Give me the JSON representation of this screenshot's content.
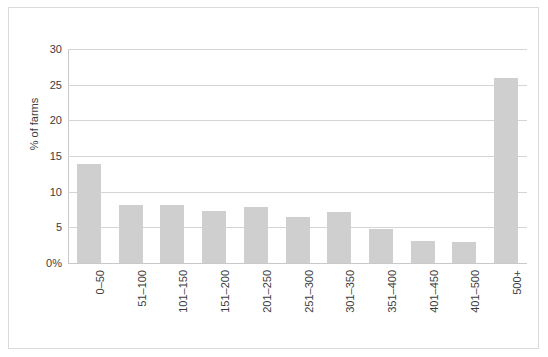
{
  "chart_data": {
    "type": "bar",
    "title": "",
    "subtitle": "",
    "xlabel": "",
    "ylabel": "% of farms",
    "categories": [
      "0–50",
      "51–100",
      "101–150",
      "151–200",
      "201–250",
      "251–300",
      "301–350",
      "351–400",
      "401–450",
      "401–500",
      "500+"
    ],
    "values": [
      13.9,
      8.1,
      8.1,
      7.3,
      7.9,
      6.4,
      7.2,
      4.8,
      3.1,
      3.0,
      25.9
    ],
    "ylim": [
      0,
      30
    ],
    "ytick_values": [
      0,
      5,
      10,
      15,
      20,
      25,
      30
    ],
    "ytick_labels": [
      "0%",
      "5",
      "10",
      "15",
      "20",
      "25",
      "30"
    ],
    "grid": true,
    "legend": false,
    "legend_position": "none",
    "bar_color": "#cfcfcf",
    "gridline_color": "#d5d5d5",
    "text_color": "#3c3c3c",
    "frame_color": "#d9dade",
    "xtick_rotation": -90
  }
}
